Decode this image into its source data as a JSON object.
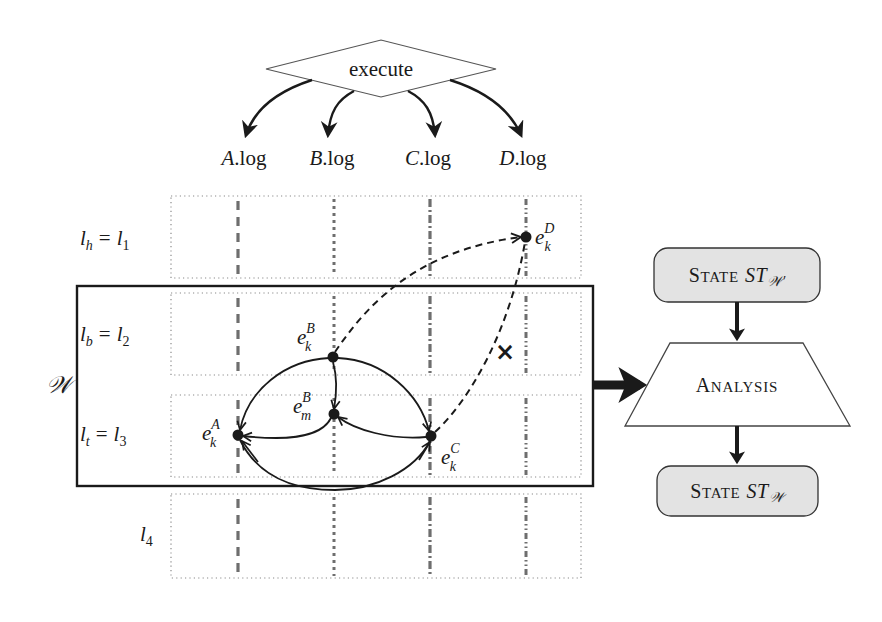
{
  "diagram": {
    "execute": {
      "label": "execute",
      "logs": [
        {
          "var": "A",
          "suffix": ".log"
        },
        {
          "var": "B",
          "suffix": ".log"
        },
        {
          "var": "C",
          "suffix": ".log"
        },
        {
          "var": "D",
          "suffix": ".log"
        }
      ]
    },
    "levels": [
      {
        "lhs": "l",
        "lhs_sub": "h",
        "eq": "=",
        "rhs": "l",
        "rhs_sub": "1"
      },
      {
        "lhs": "l",
        "lhs_sub": "b",
        "eq": "=",
        "rhs": "l",
        "rhs_sub": "2"
      },
      {
        "lhs": "l",
        "lhs_sub": "t",
        "eq": "=",
        "rhs": "l",
        "rhs_sub": "3"
      },
      {
        "lhs": "",
        "lhs_sub": "",
        "eq": "",
        "rhs": "l",
        "rhs_sub": "4"
      }
    ],
    "window": {
      "label": "𝒲"
    },
    "events": [
      {
        "id": "ekA",
        "base": "e",
        "sup": "A",
        "sub": "k"
      },
      {
        "id": "ekB",
        "base": "e",
        "sup": "B",
        "sub": "k"
      },
      {
        "id": "emB",
        "base": "e",
        "sup": "B",
        "sub": "m"
      },
      {
        "id": "ekC",
        "base": "e",
        "sup": "C",
        "sub": "k"
      },
      {
        "id": "ekD",
        "base": "e",
        "sup": "D",
        "sub": "k"
      }
    ],
    "invalid_marker": "×",
    "flow": {
      "state_prev": {
        "word_first": "S",
        "word_rest": "TATE",
        "math": "ST",
        "math_sub": "𝒲′"
      },
      "analysis": {
        "word_first": "A",
        "word_rest": "NALYSIS"
      },
      "state_next": {
        "word_first": "S",
        "word_rest": "TATE",
        "math": "ST",
        "math_sub": "𝒲"
      }
    },
    "colors": {
      "ink": "#1a1a1a",
      "grid_dotted": "#8a8a8a",
      "state_fill": "#e3e3e3",
      "dashed_lines": "#6e6e6e"
    }
  }
}
